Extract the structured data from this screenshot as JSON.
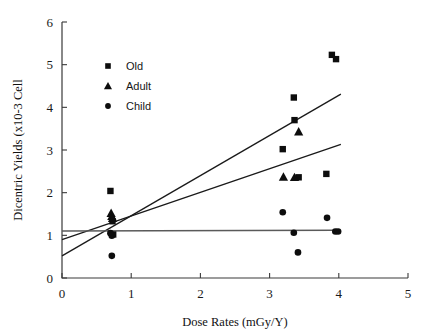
{
  "chart_data": {
    "type": "scatter",
    "title": "",
    "xlabel": "Dose Rates (mGy/Y)",
    "ylabel": "Dicentric Yields (x10-3 Cell",
    "xlim": [
      0,
      5
    ],
    "ylim": [
      0,
      6
    ],
    "xticks": [
      "0",
      "1",
      "2",
      "3",
      "4",
      "5"
    ],
    "yticks": [
      "0",
      "1",
      "2",
      "3",
      "4",
      "5",
      "6"
    ],
    "grid": false,
    "legend_position": "upper-left-inside",
    "legend": [
      {
        "label": "Old",
        "marker": "square"
      },
      {
        "label": "Adult",
        "marker": "triangle"
      },
      {
        "label": "Child",
        "marker": "circle"
      }
    ],
    "series": [
      {
        "name": "Old",
        "marker": "square",
        "points": [
          [
            0.7,
            2.04
          ],
          [
            0.73,
            1.33
          ],
          [
            0.74,
            1.02
          ],
          [
            3.19,
            3.02
          ],
          [
            3.35,
            4.23
          ],
          [
            3.36,
            3.7
          ],
          [
            3.42,
            2.36
          ],
          [
            3.82,
            2.44
          ],
          [
            3.9,
            5.23
          ],
          [
            3.96,
            5.13
          ]
        ]
      },
      {
        "name": "Adult",
        "marker": "triangle",
        "points": [
          [
            0.71,
            1.52
          ],
          [
            0.72,
            1.45
          ],
          [
            0.73,
            1.4
          ],
          [
            3.2,
            2.37
          ],
          [
            3.36,
            2.36
          ],
          [
            3.42,
            3.43
          ]
        ]
      },
      {
        "name": "Child",
        "marker": "circle",
        "points": [
          [
            0.7,
            1.05
          ],
          [
            0.72,
            0.99
          ],
          [
            0.72,
            0.52
          ],
          [
            3.19,
            1.54
          ],
          [
            3.35,
            1.06
          ],
          [
            3.41,
            0.6
          ],
          [
            3.83,
            1.41
          ],
          [
            3.95,
            1.09
          ],
          [
            3.99,
            1.09
          ]
        ]
      }
    ],
    "fit_lines": [
      {
        "name": "Old",
        "x0": 0.0,
        "y0": 0.52,
        "x1": 4.03,
        "y1": 4.31
      },
      {
        "name": "Adult",
        "x0": 0.0,
        "y0": 0.9,
        "x1": 4.03,
        "y1": 3.13
      },
      {
        "name": "Child",
        "x0": 0.0,
        "y0": 1.1,
        "x1": 3.99,
        "y1": 1.12
      }
    ]
  }
}
